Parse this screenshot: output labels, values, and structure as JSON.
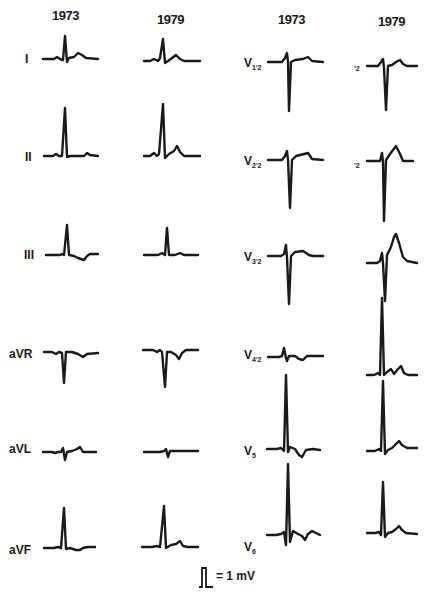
{
  "figure": {
    "columns": [
      {
        "label": "1973",
        "group": "limb"
      },
      {
        "label": "1979",
        "group": "limb"
      },
      {
        "label": "1973",
        "group": "precordial"
      },
      {
        "label": "1979",
        "group": "precordial"
      }
    ],
    "limb_leads": [
      "I",
      "II",
      "III",
      "aVR",
      "aVL",
      "aVF"
    ],
    "precordial_leads": [
      {
        "lead": "V",
        "sub": "1'2"
      },
      {
        "lead": "V",
        "sub": "2'2"
      },
      {
        "lead": "V",
        "sub": "3'2"
      },
      {
        "lead": "V",
        "sub": "4'2"
      },
      {
        "lead": "V",
        "sub": "5"
      },
      {
        "lead": "V",
        "sub": "6"
      }
    ],
    "precordial_1979_fragments": [
      "'2",
      "'2"
    ],
    "calibration": {
      "label": "= 1 mV"
    }
  }
}
